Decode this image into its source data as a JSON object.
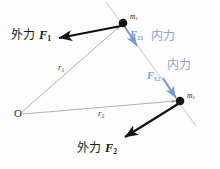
{
  "figure": {
    "type": "physics-free-body-diagram",
    "canvas": {
      "width": 220,
      "height": 169,
      "background": "#fdfdfd"
    },
    "colors": {
      "internal_force_blue": "#7a97cf",
      "internal_label_blue": "#8aa4d4",
      "external_force_black": "#111111",
      "position_vector_gray": "#a8a8a8",
      "connecting_line_gray": "#c9c9c9",
      "mass_dot": "#141414"
    },
    "points": {
      "origin": {
        "label": "O",
        "x": 22,
        "y": 114
      },
      "mass1": {
        "label": "m",
        "sub": "1",
        "x": 123,
        "y": 23
      },
      "mass2": {
        "label": "m",
        "sub": "2",
        "x": 180,
        "y": 101
      }
    },
    "position_vectors": [
      {
        "name": "r1",
        "label": "r",
        "sub": "1",
        "from": "origin",
        "to": "mass1",
        "label_x": 61,
        "label_y": 67
      },
      {
        "name": "r2",
        "label": "r",
        "sub": "2",
        "from": "origin",
        "to": "mass2",
        "label_x": 101,
        "label_y": 113
      }
    ],
    "external_forces": [
      {
        "name": "F1",
        "cjk_label": "外力",
        "symbol": "F",
        "sub": "1",
        "applied_at": "mass1",
        "arrow_from": {
          "x": 121,
          "y": 26
        },
        "arrow_to": {
          "x": 58,
          "y": 38
        },
        "label_x": 12,
        "label_y": 31
      },
      {
        "name": "F2",
        "cjk_label": "外力",
        "symbol": "F",
        "sub": "2",
        "applied_at": "mass2",
        "arrow_from": {
          "x": 178,
          "y": 104
        },
        "arrow_to": {
          "x": 123,
          "y": 139
        },
        "label_x": 78,
        "label_y": 144
      }
    ],
    "internal_forces": [
      {
        "name": "F21",
        "symbol": "F",
        "sub": "21",
        "cjk_label": "内力",
        "acts_on": "mass1",
        "arrow_from": {
          "x": 125,
          "y": 27
        },
        "arrow_to": {
          "x": 137,
          "y": 47
        },
        "sym_x": 131,
        "sym_y": 30,
        "cjk_x": 152,
        "cjk_y": 28
      },
      {
        "name": "F12",
        "symbol": "F",
        "sub": "12",
        "cjk_label": "内力",
        "acts_on": "mass2",
        "arrow_from": {
          "x": 163,
          "y": 78
        },
        "arrow_to": {
          "x": 177,
          "y": 99
        },
        "sym_x": 149,
        "sym_y": 73,
        "cjk_x": 168,
        "cjk_y": 58
      }
    ],
    "connecting_line": {
      "name": "line-of-action-through-masses",
      "from": {
        "x": 106,
        "y": 2
      },
      "to": {
        "x": 196,
        "y": 126
      }
    }
  }
}
